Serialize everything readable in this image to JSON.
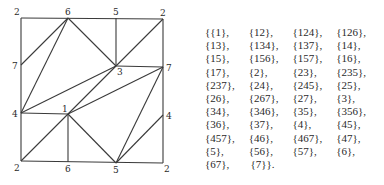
{
  "diagram": {
    "vertices": [
      {
        "id": "tl",
        "label": "2",
        "x": 21,
        "y": 18,
        "lx": 14,
        "ly": 15
      },
      {
        "id": "t6",
        "label": "6",
        "x": 68,
        "y": 18,
        "lx": 65,
        "ly": 15
      },
      {
        "id": "t5",
        "label": "5",
        "x": 116,
        "y": 18,
        "lx": 113,
        "ly": 15
      },
      {
        "id": "tr",
        "label": "2",
        "x": 163,
        "y": 19,
        "lx": 160,
        "ly": 16
      },
      {
        "id": "l7",
        "label": "7",
        "x": 21,
        "y": 65,
        "lx": 12,
        "ly": 69
      },
      {
        "id": "c3",
        "label": "3",
        "x": 116,
        "y": 66,
        "lx": 117,
        "ly": 75
      },
      {
        "id": "r7",
        "label": "7",
        "x": 163,
        "y": 67,
        "lx": 166,
        "ly": 71
      },
      {
        "id": "l4",
        "label": "4",
        "x": 21,
        "y": 113,
        "lx": 12,
        "ly": 117
      },
      {
        "id": "c1",
        "label": "1",
        "x": 68,
        "y": 114,
        "lx": 62,
        "ly": 112
      },
      {
        "id": "r4",
        "label": "4",
        "x": 163,
        "y": 115,
        "lx": 166,
        "ly": 119
      },
      {
        "id": "bl",
        "label": "2",
        "x": 21,
        "y": 161,
        "lx": 14,
        "ly": 171
      },
      {
        "id": "b6",
        "label": "6",
        "x": 68,
        "y": 162,
        "lx": 65,
        "ly": 172
      },
      {
        "id": "b5",
        "label": "5",
        "x": 116,
        "y": 163,
        "lx": 113,
        "ly": 173
      },
      {
        "id": "br",
        "label": "2",
        "x": 163,
        "y": 163,
        "lx": 164,
        "ly": 172
      }
    ],
    "edges": [
      [
        "tl",
        "tr"
      ],
      [
        "tr",
        "br"
      ],
      [
        "br",
        "bl"
      ],
      [
        "bl",
        "tl"
      ],
      [
        "t5",
        "c3"
      ],
      [
        "c3",
        "r7"
      ],
      [
        "t6",
        "l7"
      ],
      [
        "t6",
        "l4"
      ],
      [
        "t6",
        "c3"
      ],
      [
        "c3",
        "tr"
      ],
      [
        "c3",
        "l4"
      ],
      [
        "c3",
        "c1"
      ],
      [
        "r7",
        "c1"
      ],
      [
        "r7",
        "b5"
      ],
      [
        "l4",
        "c1"
      ],
      [
        "c1",
        "bl"
      ],
      [
        "c1",
        "b6"
      ],
      [
        "c1",
        "b5"
      ],
      [
        "b5",
        "r4"
      ]
    ]
  },
  "sets": {
    "rows": [
      [
        "{{1},",
        "{12},",
        "{124},",
        "{126},"
      ],
      [
        "{13},",
        "{134},",
        "{137},",
        "{14},"
      ],
      [
        "{15},",
        "{156},",
        "{157},",
        "{16},"
      ],
      [
        "{17},",
        "{2},",
        "{23},",
        "{235},"
      ],
      [
        "{237},",
        "{24},",
        "{245},",
        "{25},"
      ],
      [
        "{26},",
        "{267},",
        "{27},",
        "{3},"
      ],
      [
        "{34},",
        "{346},",
        "{35},",
        "{356},"
      ],
      [
        "{36},",
        "{37},",
        "{4},",
        "{45},"
      ],
      [
        "{457},",
        "{46},",
        "{467},",
        "{47},"
      ],
      [
        "{5},",
        "{56},",
        "{57},",
        "{6},"
      ],
      [
        "{67},",
        "{7}}."
      ]
    ]
  }
}
